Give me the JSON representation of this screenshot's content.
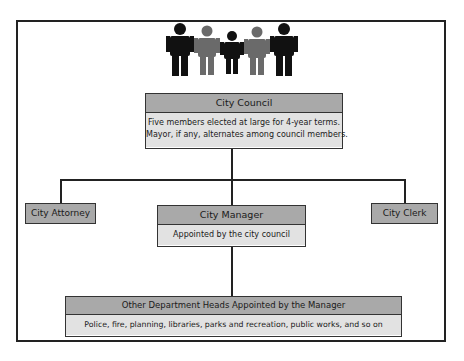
{
  "diagram": {
    "type": "org-chart",
    "icon": "people-group-icon",
    "colors": {
      "header_fill": "#a9a9a9",
      "body_fill": "#e2e2e2",
      "lines": "#222222",
      "figure_dark": "#111111",
      "figure_gray": "#6a6a6a"
    },
    "council": {
      "title": "City Council",
      "line1": "Five members elected at large for 4-year terms.",
      "line2": "Mayor, if any, alternates among council members."
    },
    "attorney": {
      "title": "City Attorney"
    },
    "manager": {
      "title": "City Manager",
      "description": "Appointed by the city council"
    },
    "clerk": {
      "title": "City Clerk"
    },
    "departments": {
      "title": "Other Department Heads Appointed by the Manager",
      "description": "Police, fire, planning, libraries, parks and recreation, public works, and so on"
    }
  }
}
